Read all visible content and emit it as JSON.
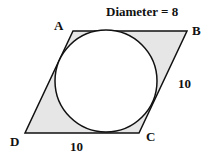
{
  "title": "Diameter = 8",
  "vertices": {
    "A": {
      "label": "A",
      "x": 73,
      "y": 31
    },
    "B": {
      "label": "B",
      "x": 187,
      "y": 31
    },
    "C": {
      "label": "C",
      "x": 139,
      "y": 133
    },
    "D": {
      "label": "D",
      "x": 25,
      "y": 133
    }
  },
  "side_labels": {
    "BC": "10",
    "DC": "10"
  },
  "circle": {
    "cx": 106,
    "cy": 81,
    "r": 51
  },
  "colors": {
    "shade": "#e6e6e6",
    "stroke": "#111111",
    "circle_fill": "#ffffff"
  }
}
